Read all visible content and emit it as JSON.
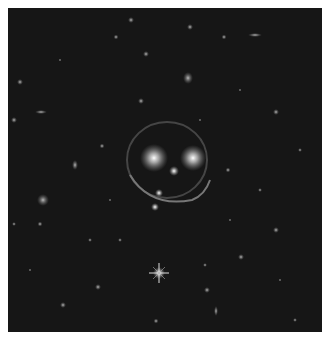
{
  "image": {
    "subject": "Galaxy cluster with gravitational lensing arcs resembling a smiley face",
    "background_color": "#141414",
    "border_color": "#ffffff",
    "features": {
      "eyes": [
        {
          "x": 150,
          "y": 150,
          "r": 9
        },
        {
          "x": 184,
          "y": 148,
          "r": 8
        }
      ],
      "nose": {
        "x": 164,
        "y": 162,
        "r": 4
      },
      "smile_arc": {
        "cx": 167,
        "cy": 160,
        "rx": 42,
        "ry": 40
      },
      "bright_star": {
        "x": 150,
        "y": 267
      }
    }
  }
}
